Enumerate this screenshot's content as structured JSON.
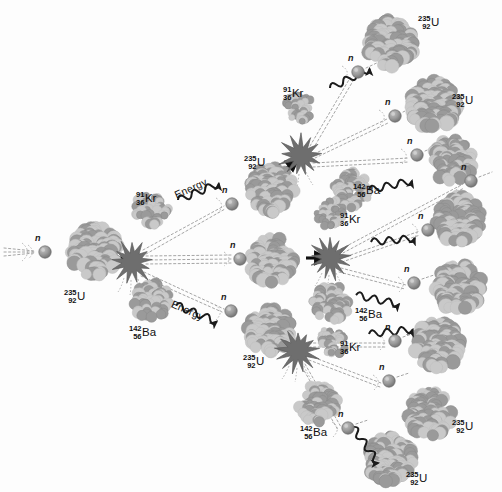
{
  "figure": {
    "background_color": "#fdfdfd",
    "nucleus_light_color": "#c9c9c9",
    "nucleus_dark_color": "#9a9a9a",
    "neutron_color": "#8d8d8d",
    "burst_color": "#6e6e6e",
    "arrow_color": "#111111",
    "text_color": "#111111"
  },
  "labels": {
    "uranium": {
      "mass": "235",
      "atomic": "92",
      "symbol": "U"
    },
    "krypton": {
      "mass": "91",
      "atomic": "36",
      "symbol": "Kr"
    },
    "barium": {
      "mass": "142",
      "atomic": "56",
      "symbol": "Ba"
    },
    "neutron": "n",
    "energy": "Energy"
  },
  "chart_data": {
    "type": "diagram",
    "generations": 3,
    "nodes": [
      {
        "id": "n0",
        "kind": "neutron",
        "label": "n",
        "x": 45,
        "y": 252,
        "generation": 0
      },
      {
        "id": "u0",
        "kind": "nucleus",
        "label": "235 92 U",
        "x": 95,
        "y": 252,
        "r": 29,
        "generation": 0
      },
      {
        "id": "f0",
        "kind": "fission-burst",
        "x": 132,
        "y": 262,
        "generation": 0
      },
      {
        "id": "kr0",
        "kind": "nucleus",
        "label": "91 36 Kr",
        "x": 152,
        "y": 209,
        "r": 20,
        "generation": 0
      },
      {
        "id": "ba0",
        "kind": "nucleus",
        "label": "142 56 Ba",
        "x": 152,
        "y": 301,
        "r": 22,
        "generation": 0
      },
      {
        "id": "n1a",
        "kind": "neutron",
        "label": "n",
        "x": 232,
        "y": 204,
        "generation": 1
      },
      {
        "id": "n1b",
        "kind": "neutron",
        "label": "n",
        "x": 240,
        "y": 259,
        "generation": 1
      },
      {
        "id": "n1c",
        "kind": "neutron",
        "label": "n",
        "x": 231,
        "y": 311,
        "generation": 1
      },
      {
        "id": "u1a",
        "kind": "nucleus",
        "label": "235 92 U",
        "x": 272,
        "y": 190,
        "r": 27,
        "generation": 1
      },
      {
        "id": "u1b",
        "kind": "nucleus",
        "label": "235 92 U",
        "x": 272,
        "y": 260,
        "r": 27,
        "generation": 1
      },
      {
        "id": "u1c",
        "kind": "nucleus",
        "label": "235 92 U",
        "x": 270,
        "y": 331,
        "r": 27,
        "generation": 1
      },
      {
        "id": "f1a",
        "kind": "fission-burst",
        "x": 301,
        "y": 156,
        "generation": 1
      },
      {
        "id": "f1b",
        "kind": "fission-burst",
        "x": 330,
        "y": 258,
        "generation": 1
      },
      {
        "id": "f1c",
        "kind": "fission-burst",
        "x": 298,
        "y": 351,
        "generation": 1
      },
      {
        "id": "kr1a",
        "kind": "nucleus",
        "label": "91 36 Kr",
        "x": 299,
        "y": 108,
        "r": 17,
        "generation": 1
      },
      {
        "id": "ba1a",
        "kind": "nucleus",
        "label": "142 56 Ba",
        "x": 351,
        "y": 190,
        "r": 22,
        "generation": 1
      },
      {
        "id": "kr1b",
        "kind": "nucleus",
        "label": "91 36 Kr",
        "x": 330,
        "y": 213,
        "r": 17,
        "generation": 1
      },
      {
        "id": "ba1b",
        "kind": "nucleus",
        "label": "142 56 Ba",
        "x": 331,
        "y": 303,
        "r": 22,
        "generation": 1
      },
      {
        "id": "kr1c",
        "kind": "nucleus",
        "label": "91 36 Kr",
        "x": 333,
        "y": 341,
        "r": 17,
        "generation": 1
      },
      {
        "id": "ba1c",
        "kind": "nucleus",
        "label": "142 56 Ba",
        "x": 318,
        "y": 404,
        "r": 23,
        "generation": 1
      },
      {
        "id": "n2a",
        "kind": "neutron",
        "label": "n",
        "x": 358,
        "y": 72,
        "generation": 2
      },
      {
        "id": "n2b",
        "kind": "neutron",
        "label": "n",
        "x": 395,
        "y": 116,
        "generation": 2
      },
      {
        "id": "n2c",
        "kind": "neutron",
        "label": "n",
        "x": 417,
        "y": 155,
        "generation": 2
      },
      {
        "id": "n2d",
        "kind": "neutron",
        "label": "n",
        "x": 471,
        "y": 181,
        "generation": 2
      },
      {
        "id": "n2e",
        "kind": "neutron",
        "label": "n",
        "x": 428,
        "y": 230,
        "generation": 2
      },
      {
        "id": "n2f",
        "kind": "neutron",
        "label": "n",
        "x": 414,
        "y": 283,
        "generation": 2
      },
      {
        "id": "n2g",
        "kind": "neutron",
        "label": "n",
        "x": 395,
        "y": 341,
        "generation": 2
      },
      {
        "id": "n2h",
        "kind": "neutron",
        "label": "n",
        "x": 389,
        "y": 381,
        "generation": 2
      },
      {
        "id": "n2i",
        "kind": "neutron",
        "label": "n",
        "x": 348,
        "y": 428,
        "generation": 2
      },
      {
        "id": "u2a",
        "kind": "nucleus",
        "label": "235 92 U",
        "x": 391,
        "y": 43,
        "r": 29,
        "generation": 2
      },
      {
        "id": "u2b",
        "kind": "nucleus",
        "label": "235 92 U",
        "x": 434,
        "y": 105,
        "r": 29,
        "generation": 2
      },
      {
        "id": "u2c",
        "kind": "nucleus",
        "label": "235 92 U",
        "x": 452,
        "y": 160,
        "r": 26,
        "generation": 2
      },
      {
        "id": "u2d",
        "kind": "nucleus",
        "label": "235 92 U",
        "x": 459,
        "y": 219,
        "r": 28,
        "generation": 2
      },
      {
        "id": "u2e",
        "kind": "nucleus",
        "label": "235 92 U",
        "x": 459,
        "y": 287,
        "r": 28,
        "generation": 2
      },
      {
        "id": "u2f",
        "kind": "nucleus",
        "label": "235 92 U",
        "x": 437,
        "y": 345,
        "r": 28,
        "generation": 2
      },
      {
        "id": "u2g",
        "kind": "nucleus",
        "label": "235 92 U",
        "x": 430,
        "y": 414,
        "r": 27,
        "generation": 2
      },
      {
        "id": "u2h",
        "kind": "nucleus",
        "label": "235 92 U",
        "x": 390,
        "y": 459,
        "r": 28,
        "generation": 2
      }
    ],
    "energy_arrows": [
      {
        "from": "f0",
        "x": 178,
        "y": 200,
        "angle": -22
      },
      {
        "from": "f0",
        "x": 176,
        "y": 305,
        "angle": 22
      },
      {
        "from": "f1a",
        "x": 330,
        "y": 88,
        "angle": -26
      },
      {
        "from": "f1b",
        "x": 369,
        "y": 190,
        "angle": -12
      },
      {
        "from": "f1b",
        "x": 371,
        "y": 242,
        "angle": -5
      },
      {
        "from": "f1b",
        "x": 356,
        "y": 295,
        "angle": 12
      },
      {
        "from": "f1c",
        "x": 369,
        "y": 334,
        "angle": -6
      },
      {
        "from": "f1c",
        "x": 353,
        "y": 427,
        "angle": 55
      }
    ]
  },
  "text_labels": [
    {
      "kind": "iso",
      "iso": "uranium",
      "x": 64,
      "y": 282
    },
    {
      "kind": "iso",
      "iso": "krypton",
      "x": 136,
      "y": 184
    },
    {
      "kind": "iso",
      "iso": "barium",
      "x": 129,
      "y": 318
    },
    {
      "kind": "iso",
      "iso": "uranium",
      "x": 244,
      "y": 148
    },
    {
      "kind": "iso",
      "iso": "uranium",
      "x": 243,
      "y": 347
    },
    {
      "kind": "iso",
      "iso": "krypton",
      "x": 283,
      "y": 79
    },
    {
      "kind": "iso",
      "iso": "krypton",
      "x": 340,
      "y": 205
    },
    {
      "kind": "iso",
      "iso": "krypton",
      "x": 340,
      "y": 333
    },
    {
      "kind": "iso",
      "iso": "barium",
      "x": 353,
      "y": 176
    },
    {
      "kind": "iso",
      "iso": "barium",
      "x": 355,
      "y": 300
    },
    {
      "kind": "iso",
      "iso": "barium",
      "x": 300,
      "y": 418
    },
    {
      "kind": "iso",
      "iso": "uranium",
      "x": 418,
      "y": 8
    },
    {
      "kind": "iso",
      "iso": "uranium",
      "x": 452,
      "y": 86
    },
    {
      "kind": "iso",
      "iso": "uranium",
      "x": 452,
      "y": 412
    },
    {
      "kind": "iso",
      "iso": "uranium",
      "x": 406,
      "y": 464
    },
    {
      "kind": "energy",
      "text": "Energy",
      "x": 175,
      "y": 190,
      "rot": -24
    },
    {
      "kind": "energy",
      "text": "Energy",
      "x": 172,
      "y": 298,
      "rot": 24
    }
  ]
}
